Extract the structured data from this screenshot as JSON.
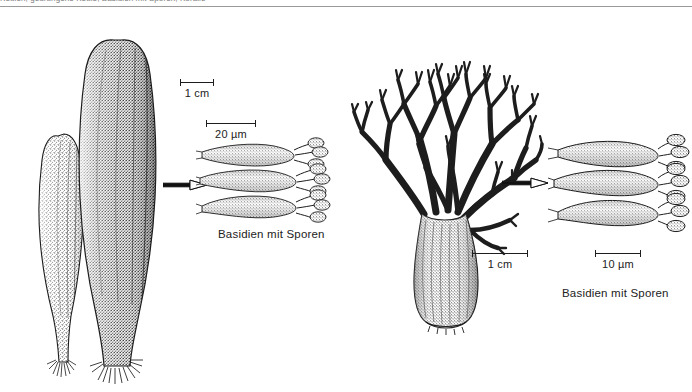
{
  "page": {
    "width": 692,
    "height": 392,
    "background": "#ffffff",
    "ink": "#1d1d1d",
    "header_caption": "Keulen, gedrungene Keule, Basidien mit Sporen, Koralle"
  },
  "figures": {
    "clubs": {
      "name": "club-fungi-illustration",
      "description": "Two club-shaped fruiting bodies (Clavariadelphus) with stippled shading and basal hairs"
    },
    "coral": {
      "name": "coral-fungus-illustration",
      "description": "Branched coral fungus (Ramaria) with thick stipe and repeatedly forked branches"
    },
    "basidia_left": {
      "name": "basidia-detail-left",
      "description": "Three club-shaped basidia bearing spores on sterigmata"
    },
    "basidia_right": {
      "name": "basidia-detail-right",
      "description": "Three club-shaped basidia bearing spores on sterigmata"
    }
  },
  "scalebars": [
    {
      "id": "club-scale",
      "label": "1 cm",
      "length_px": 34
    },
    {
      "id": "basidia-left-scale",
      "label": "20 µm",
      "length_px": 50
    },
    {
      "id": "coral-scale",
      "label": "1 cm",
      "length_px": 56
    },
    {
      "id": "basidia-right-scale",
      "label": "10 µm",
      "length_px": 46
    }
  ],
  "captions": {
    "basidia_left": "Basidien mit Sporen",
    "basidia_right": "Basidien mit Sporen"
  },
  "arrows": {
    "left": {
      "name": "pointer-arrow-left",
      "direction": "right"
    },
    "right": {
      "name": "pointer-arrow-right",
      "direction": "right"
    }
  }
}
